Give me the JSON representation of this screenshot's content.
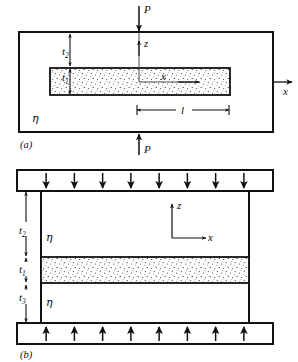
{
  "figure": {
    "caption_a": "(a)",
    "caption_b": "(b)",
    "panel_a": {
      "load_top_label": "P",
      "load_bottom_label": "P",
      "axis_z_label": "z",
      "axis_x_label": "x",
      "axis_x_inner_label": "x",
      "matrix_label": "η",
      "thickness_t2_base": "t",
      "thickness_t2_sub": "2",
      "thickness_t1_base": "t",
      "thickness_t1_sub": "1",
      "length_label": "l"
    },
    "panel_b": {
      "axis_z_label": "z",
      "axis_x_label": "x",
      "matrix_label_upper": "η",
      "matrix_label_lower": "η",
      "thickness_t2_base": "t",
      "thickness_t2_sub": "2",
      "thickness_t1_base": "t",
      "thickness_t1_sub": "1",
      "thickness_t3_base": "t",
      "thickness_t3_sub": "3",
      "top_arrow_count": 8,
      "bottom_arrow_count": 8
    },
    "colors": {
      "ink": "#111111",
      "stipple": "#2a2a2a",
      "background": "#ffffff"
    }
  }
}
